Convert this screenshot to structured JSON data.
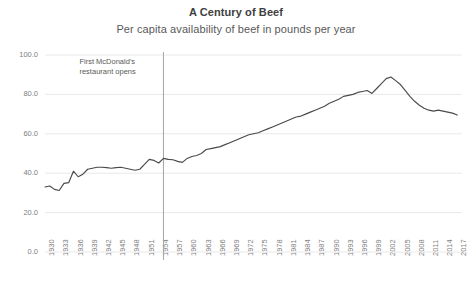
{
  "chart_data": {
    "type": "line",
    "title": "A Century of Beef",
    "subtitle": "Per capita availability of beef in pounds per year",
    "xlabel": "",
    "ylabel": "",
    "ylim": [
      0,
      100
    ],
    "ytick_step": 20,
    "ytick_labels": [
      "0.0",
      "20.0",
      "40.0",
      "60.0",
      "80.0",
      "100.0"
    ],
    "ytick_values": [
      0,
      20,
      40,
      60,
      80,
      100
    ],
    "xlim": [
      1930,
      2018
    ],
    "xtick_labels": [
      "1930",
      "1933",
      "1936",
      "1939",
      "1942",
      "1945",
      "1948",
      "1951",
      "1954",
      "1957",
      "1960",
      "1963",
      "1966",
      "1969",
      "1972",
      "1975",
      "1978",
      "1981",
      "1984",
      "1987",
      "1990",
      "1993",
      "1996",
      "1999",
      "2002",
      "2005",
      "2008",
      "2011",
      "2014",
      "2017"
    ],
    "grid": "horizontal",
    "legend": "none",
    "line_color": "#4a4a4a",
    "grid_color": "#e8e8e8",
    "annotations": [
      {
        "name": "mcdonalds-marker",
        "text_line1": "First McDonald's",
        "text_line2": "restaurant opens",
        "x_value": 1955,
        "line_color": "#a6a6a6"
      }
    ],
    "x": [
      1930,
      1931,
      1932,
      1933,
      1934,
      1935,
      1936,
      1937,
      1938,
      1939,
      1940,
      1941,
      1942,
      1943,
      1944,
      1945,
      1946,
      1947,
      1948,
      1949,
      1950,
      1951,
      1952,
      1953,
      1954,
      1955,
      1956,
      1957,
      1958,
      1959,
      1960,
      1961,
      1962,
      1963,
      1964,
      1965,
      1966,
      1967,
      1968,
      1969,
      1970,
      1971,
      1972,
      1973,
      1974,
      1975,
      1976,
      1977,
      1978,
      1979,
      1980,
      1981,
      1982,
      1983,
      1984,
      1985,
      1986,
      1987,
      1988,
      1989,
      1990,
      1991,
      1992,
      1993,
      1994,
      1995,
      1996,
      1997,
      1998,
      1999,
      2000,
      2001,
      2002,
      2003,
      2004,
      2005,
      2006,
      2007,
      2008,
      2009,
      2010,
      2011,
      2012,
      2013,
      2014,
      2015,
      2016,
      2017
    ],
    "values": [
      33.0,
      33.5,
      31.8,
      31.2,
      34.8,
      35.2,
      41.0,
      38.2,
      39.5,
      42.0,
      42.5,
      43.0,
      43.0,
      42.8,
      42.5,
      42.8,
      43.0,
      42.5,
      42.0,
      41.5,
      42.0,
      44.5,
      47.0,
      46.5,
      45.2,
      47.5,
      47.0,
      46.8,
      46.0,
      45.5,
      47.5,
      48.5,
      49.0,
      50.0,
      52.0,
      52.5,
      53.0,
      53.5,
      54.5,
      55.5,
      56.5,
      57.5,
      58.5,
      59.5,
      60.0,
      60.5,
      61.5,
      62.5,
      63.5,
      64.5,
      65.5,
      66.5,
      67.5,
      68.5,
      69.0,
      70.0,
      71.0,
      72.0,
      73.0,
      74.0,
      75.5,
      76.5,
      77.5,
      79.0,
      79.5,
      80.0,
      81.0,
      81.5,
      82.0,
      80.5,
      83.0,
      85.5,
      88.0,
      88.8,
      87.0,
      85.0,
      82.0,
      79.0,
      76.5,
      74.5,
      73.0,
      72.0,
      71.5,
      72.0,
      71.5,
      71.0,
      70.5,
      69.5
    ],
    "values_note": "Series continues to 2017; full series below in series_full",
    "series_full": {
      "name": "Beef availability (lbs/person/year)",
      "years": [
        1930,
        1933,
        1936,
        1939,
        1942,
        1945,
        1948,
        1951,
        1954,
        1957,
        1960,
        1963,
        1966,
        1969,
        1972,
        1975,
        1978,
        1981,
        1984,
        1987,
        1990,
        1993,
        1996,
        1999,
        2002,
        2005,
        2008,
        2011,
        2014,
        2017
      ],
      "values_at_ticks": [
        33.0,
        31.2,
        41.0,
        42.0,
        43.0,
        42.8,
        42.0,
        44.5,
        45.2,
        46.8,
        47.5,
        50.0,
        53.0,
        55.5,
        58.5,
        88.0,
        79.0,
        73.5,
        76.0,
        72.5,
        67.5,
        65.0,
        67.0,
        68.0,
        67.5,
        66.0,
        62.5,
        57.0,
        53.5,
        55.0
      ]
    }
  }
}
